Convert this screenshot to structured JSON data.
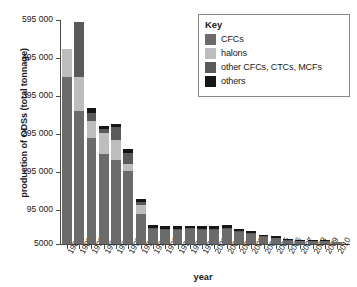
{
  "chart_data": {
    "type": "bar",
    "stacked": true,
    "title": "",
    "xlabel": "year",
    "ylabel": "production of ODSs (total tonnage)",
    "ylim": [
      5000,
      595000
    ],
    "ytick_labels": [
      "595 000",
      "495 000",
      "395 000",
      "295 000",
      "195 000",
      "95 000",
      "5000"
    ],
    "ytick_values": [
      595000,
      495000,
      395000,
      295000,
      195000,
      95000,
      5000
    ],
    "grid": false,
    "legend_position": "top-right",
    "legend_title": "Key",
    "categories": [
      "1988",
      "1989",
      "1990",
      "1991",
      "1992",
      "1993",
      "1994",
      "1995",
      "1996",
      "1997",
      "1998",
      "1999",
      "2000",
      "2001",
      "2002",
      "2003",
      "2004",
      "2005",
      "2006",
      "2007",
      "2008",
      "2009",
      "2010"
    ],
    "series": [
      {
        "name": "CFCs",
        "color": "#6b6b6b",
        "values": [
          440000,
          350000,
          280000,
          238000,
          222000,
          192000,
          78000,
          40000,
          38000,
          38000,
          39000,
          37000,
          37000,
          39000,
          32000,
          26000,
          19000,
          15000,
          8000,
          7000,
          7000,
          7000,
          5000
        ]
      },
      {
        "name": "halons",
        "color": "#bdbdbd",
        "values": [
          73000,
          90000,
          43000,
          55000,
          52000,
          20000,
          26000,
          0,
          0,
          0,
          0,
          0,
          0,
          0,
          0,
          0,
          0,
          0,
          0,
          0,
          0,
          0,
          0
        ]
      },
      {
        "name": "other CFCs, CTCs, MCFs",
        "color": "#5a5a5a",
        "values": [
          0,
          145000,
          22000,
          11000,
          35000,
          27000,
          8000,
          2500,
          2500,
          2500,
          2500,
          2500,
          2500,
          2500,
          2500,
          2500,
          2000,
          2000,
          1500,
          1500,
          1500,
          1500,
          0
        ]
      },
      {
        "name": "others",
        "color": "#161616",
        "values": [
          0,
          0,
          13000,
          8000,
          8000,
          11000,
          6000,
          7500,
          7000,
          7000,
          7000,
          7000,
          7000,
          7500,
          6000,
          5000,
          4000,
          4000,
          3000,
          3000,
          3000,
          2500,
          0
        ]
      }
    ]
  }
}
